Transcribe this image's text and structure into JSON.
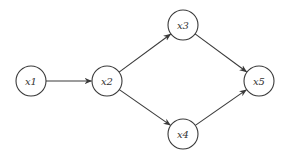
{
  "diagram": {
    "type": "directed-graph",
    "nodes": [
      {
        "id": "x1",
        "label": "x1",
        "cx": 31,
        "cy": 81,
        "r": 15
      },
      {
        "id": "x2",
        "label": "x2",
        "cx": 107,
        "cy": 81,
        "r": 15
      },
      {
        "id": "x3",
        "label": "x3",
        "cx": 183,
        "cy": 25,
        "r": 15
      },
      {
        "id": "x4",
        "label": "x4",
        "cx": 183,
        "cy": 134,
        "r": 15
      },
      {
        "id": "x5",
        "label": "x5",
        "cx": 259,
        "cy": 81,
        "r": 15
      }
    ],
    "edges": [
      {
        "from": "x1",
        "to": "x2"
      },
      {
        "from": "x2",
        "to": "x3"
      },
      {
        "from": "x2",
        "to": "x4"
      },
      {
        "from": "x3",
        "to": "x5"
      },
      {
        "from": "x4",
        "to": "x5"
      }
    ],
    "colors": {
      "stroke": "#3a3a3a",
      "background": "#ffffff",
      "text": "#333333"
    }
  }
}
